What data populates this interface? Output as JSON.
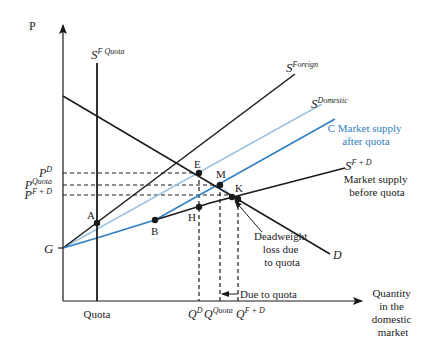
{
  "diagram": {
    "type": "supply-demand-quota",
    "axes": {
      "y_label": "P",
      "x_label_lines": [
        "Quantity",
        "in the",
        "domestic",
        "market"
      ]
    },
    "curves": {
      "s_foreign": {
        "label_base": "S",
        "label_sup": "Foreign",
        "color": "#1a1a1a"
      },
      "s_domestic": {
        "label_base": "S",
        "label_sup": "Domestic",
        "color": "#9ec3e2"
      },
      "s_market_after_quota": {
        "label_lines": [
          "C Market supply",
          "after quota"
        ],
        "color": "#2f7ec2"
      },
      "s_f_plus_d": {
        "label_base": "S",
        "label_sup": "F + D",
        "desc_lines": [
          "Market supply",
          "before quota"
        ],
        "color": "#1a1a1a"
      },
      "s_f_quota": {
        "label_base": "S",
        "label_sup": "F Quota",
        "color": "#1a1a1a"
      },
      "demand": {
        "label": "D",
        "color": "#1a1a1a"
      }
    },
    "price_levels": [
      {
        "base": "P",
        "sup": "D"
      },
      {
        "base": "P",
        "sup": "Quota"
      },
      {
        "base": "P",
        "sup": "F + D"
      }
    ],
    "quantity_levels": [
      {
        "base": "Q",
        "sup": "D"
      },
      {
        "base": "Q",
        "sup": "Quota"
      },
      {
        "base": "Q",
        "sup": "F + D"
      }
    ],
    "quota_label": "Quota",
    "origin_label": "G",
    "points": {
      "A": "A",
      "B": "B",
      "E": "E",
      "H": "H",
      "M": "M",
      "K": "K"
    },
    "annotations": {
      "deadweight_lines": [
        "Deadweight",
        "loss due",
        "to quota"
      ],
      "due_to_quota": "Due to quota"
    },
    "colors": {
      "dwl_fill": "#bcd8ef",
      "axis": "#1a1a1a"
    }
  }
}
